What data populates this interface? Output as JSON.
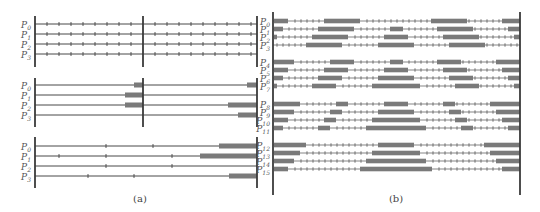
{
  "colors": {
    "line": "#333333",
    "axis": "#3a3a3a",
    "bar": "#7a7a7a",
    "text": "#555555"
  },
  "panel_a": {
    "caption": "(a)",
    "caption_pos": [
      140,
      202
    ],
    "groups": [
      {
        "axes_x": [
          35,
          143,
          257
        ],
        "axis_y": [
          16,
          67
        ],
        "x_range": [
          35,
          257
        ],
        "rows": [
          {
            "label": "P",
            "sub": "0",
            "y": 24,
            "ticks": [
              47,
              59,
              71,
              83,
              95,
              107,
              119,
              131,
              155,
              167,
              179,
              191,
              203,
              215,
              227,
              239,
              251
            ],
            "bars": []
          },
          {
            "label": "P",
            "sub": "1",
            "y": 34,
            "ticks": [
              47,
              59,
              71,
              83,
              95,
              107,
              119,
              131,
              155,
              167,
              179,
              191,
              203,
              215,
              227,
              239,
              251
            ],
            "bars": []
          },
          {
            "label": "P",
            "sub": "2",
            "y": 44,
            "ticks": [
              47,
              59,
              71,
              83,
              95,
              107,
              119,
              131,
              155,
              167,
              179,
              191,
              203,
              215,
              227,
              239,
              251
            ],
            "bars": []
          },
          {
            "label": "P",
            "sub": "3",
            "y": 54,
            "ticks": [
              47,
              59,
              71,
              83,
              95,
              107,
              119,
              131,
              155,
              167,
              179,
              191,
              203,
              215,
              227,
              239,
              251
            ],
            "bars": []
          }
        ]
      },
      {
        "axes_x": [
          35,
          143,
          257
        ],
        "axis_y": [
          78,
          127
        ],
        "x_range": [
          35,
          257
        ],
        "rows": [
          {
            "label": "P",
            "sub": "0",
            "y": 85,
            "ticks": [],
            "bars": [
              [
                134,
                143
              ],
              [
                247,
                257
              ]
            ]
          },
          {
            "label": "P",
            "sub": "1",
            "y": 95,
            "ticks": [],
            "bars": [
              [
                125,
                143
              ]
            ]
          },
          {
            "label": "P",
            "sub": "2",
            "y": 105,
            "ticks": [],
            "bars": [
              [
                125,
                143
              ],
              [
                228,
                257
              ]
            ]
          },
          {
            "label": "P",
            "sub": "3",
            "y": 115,
            "ticks": [],
            "bars": [
              [
                238,
                257
              ]
            ]
          }
        ]
      },
      {
        "axes_x": [
          35,
          257
        ],
        "axis_y": [
          137,
          188
        ],
        "x_range": [
          35,
          257
        ],
        "rows": [
          {
            "label": "P",
            "sub": "0",
            "y": 146,
            "ticks": [
              106,
              153
            ],
            "bars": [
              [
                219,
                257
              ]
            ]
          },
          {
            "label": "P",
            "sub": "1",
            "y": 156,
            "ticks": [
              59,
              106,
              172
            ],
            "bars": [
              [
                200,
                257
              ]
            ]
          },
          {
            "label": "P",
            "sub": "2",
            "y": 166,
            "ticks": [
              106,
              172
            ],
            "bars": []
          },
          {
            "label": "P",
            "sub": "3",
            "y": 176,
            "ticks": [
              88,
              134
            ],
            "bars": [
              [
                229,
                257
              ]
            ]
          }
        ]
      }
    ]
  },
  "panel_b": {
    "caption": "(b)",
    "caption_pos": [
      396,
      202
    ],
    "axes_x": [
      273,
      520
    ],
    "axis_y": [
      12,
      195
    ],
    "tick_spacing": 6,
    "rows": [
      {
        "label": "P",
        "sub": "0",
        "y": 21,
        "bars": [
          [
            274,
            288
          ],
          [
            324,
            360
          ],
          [
            431,
            467
          ],
          [
            502,
            520
          ]
        ]
      },
      {
        "label": "P",
        "sub": "1",
        "y": 29,
        "bars": [
          [
            274,
            283
          ],
          [
            318,
            354
          ],
          [
            390,
            403
          ],
          [
            437,
            473
          ],
          [
            508,
            520
          ]
        ]
      },
      {
        "label": "P",
        "sub": "2",
        "y": 37,
        "bars": [
          [
            274,
            277
          ],
          [
            312,
            348
          ],
          [
            384,
            408
          ],
          [
            443,
            479
          ],
          [
            514,
            520
          ]
        ]
      },
      {
        "label": "P",
        "sub": "3",
        "y": 45,
        "bars": [
          [
            306,
            342
          ],
          [
            378,
            414
          ],
          [
            449,
            485
          ]
        ]
      },
      {
        "label": "P",
        "sub": "4",
        "y": 62,
        "bars": [
          [
            274,
            294
          ],
          [
            330,
            354
          ],
          [
            390,
            403
          ],
          [
            437,
            461
          ],
          [
            496,
            520
          ]
        ]
      },
      {
        "label": "P",
        "sub": "5",
        "y": 70,
        "bars": [
          [
            274,
            288
          ],
          [
            324,
            348
          ],
          [
            384,
            408
          ],
          [
            443,
            467
          ],
          [
            502,
            520
          ]
        ]
      },
      {
        "label": "P",
        "sub": "6",
        "y": 78,
        "bars": [
          [
            274,
            283
          ],
          [
            318,
            342
          ],
          [
            378,
            414
          ],
          [
            449,
            473
          ],
          [
            508,
            520
          ]
        ]
      },
      {
        "label": "P",
        "sub": "7",
        "y": 86,
        "bars": [
          [
            274,
            277
          ],
          [
            312,
            336
          ],
          [
            372,
            420
          ],
          [
            455,
            479
          ],
          [
            514,
            520
          ]
        ]
      },
      {
        "label": "P",
        "sub": "8",
        "y": 104,
        "bars": [
          [
            274,
            300
          ],
          [
            336,
            348
          ],
          [
            384,
            408
          ],
          [
            443,
            455
          ],
          [
            490,
            520
          ]
        ]
      },
      {
        "label": "P",
        "sub": "9",
        "y": 112,
        "bars": [
          [
            274,
            294
          ],
          [
            330,
            342
          ],
          [
            378,
            414
          ],
          [
            449,
            461
          ],
          [
            496,
            520
          ]
        ]
      },
      {
        "label": "P",
        "sub": "10",
        "y": 120,
        "bars": [
          [
            274,
            288
          ],
          [
            324,
            336
          ],
          [
            372,
            420
          ],
          [
            455,
            467
          ],
          [
            502,
            520
          ]
        ]
      },
      {
        "label": "P",
        "sub": "11",
        "y": 128,
        "bars": [
          [
            274,
            283
          ],
          [
            318,
            330
          ],
          [
            366,
            426
          ],
          [
            461,
            473
          ],
          [
            508,
            520
          ]
        ]
      },
      {
        "label": "P",
        "sub": "12",
        "y": 145,
        "bars": [
          [
            274,
            306
          ],
          [
            378,
            414
          ],
          [
            484,
            520
          ]
        ]
      },
      {
        "label": "P",
        "sub": "13",
        "y": 153,
        "bars": [
          [
            274,
            300
          ],
          [
            372,
            420
          ],
          [
            490,
            520
          ]
        ]
      },
      {
        "label": "P",
        "sub": "14",
        "y": 161,
        "bars": [
          [
            274,
            294
          ],
          [
            366,
            426
          ],
          [
            496,
            520
          ]
        ]
      },
      {
        "label": "P",
        "sub": "15",
        "y": 169,
        "bars": [
          [
            274,
            288
          ],
          [
            360,
            432
          ],
          [
            502,
            520
          ]
        ]
      }
    ]
  }
}
